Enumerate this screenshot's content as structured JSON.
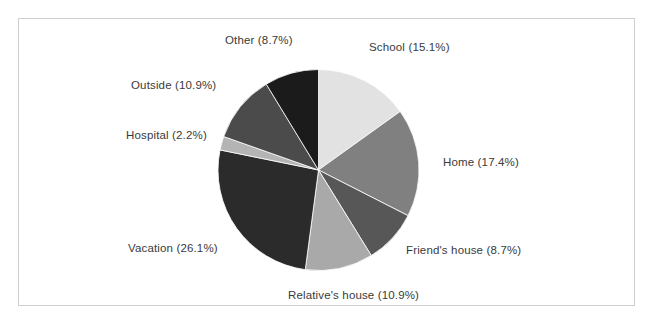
{
  "figure": {
    "background_color": "#ffffff",
    "frame_color": "#cfcfcf"
  },
  "chart_data": {
    "type": "pie",
    "title": "",
    "xlabel": "",
    "ylabel": "",
    "legend_position": "none",
    "grid": false,
    "label_format": "{name} ({percent}%)",
    "start_angle_deg": 0,
    "direction": "clockwise",
    "total_percent": 100.1,
    "categories": [
      "School",
      "Home",
      "Friend's house",
      "Relative's house",
      "Vacation",
      "Hospital",
      "Outside",
      "Other"
    ],
    "values": [
      15.1,
      17.4,
      8.7,
      10.9,
      26.1,
      2.2,
      10.9,
      8.7
    ],
    "colors": [
      "#e2e2e2",
      "#808080",
      "#575757",
      "#a9a9a9",
      "#2b2b2b",
      "#b4b4b4",
      "#4b4b4b",
      "#1b1b1b"
    ],
    "slices": [
      {
        "name": "School",
        "percent": 15.1,
        "label": "School (15.1%)",
        "color": "#e2e2e2"
      },
      {
        "name": "Home",
        "percent": 17.4,
        "label": "Home (17.4%)",
        "color": "#808080"
      },
      {
        "name": "Friend's house",
        "percent": 8.7,
        "label": "Friend's house (8.7%)",
        "color": "#575757"
      },
      {
        "name": "Relative's house",
        "percent": 10.9,
        "label": "Relative's house (10.9%)",
        "color": "#a9a9a9"
      },
      {
        "name": "Vacation",
        "percent": 26.1,
        "label": "Vacation (26.1%)",
        "color": "#2b2b2b"
      },
      {
        "name": "Hospital",
        "percent": 2.2,
        "label": "Hospital (2.2%)",
        "color": "#b4b4b4"
      },
      {
        "name": "Outside",
        "percent": 10.9,
        "label": "Outside (10.9%)",
        "color": "#4b4b4b"
      },
      {
        "name": "Other",
        "percent": 8.7,
        "label": "Other (8.7%)",
        "color": "#1b1b1b"
      }
    ]
  },
  "labels": {
    "school": "School (15.1%)",
    "home": "Home (17.4%)",
    "friends_house": "Friend's house (8.7%)",
    "relatives_house": "Relative's house (10.9%)",
    "vacation": "Vacation (26.1%)",
    "hospital": "Hospital (2.2%)",
    "outside": "Outside (10.9%)",
    "other": "Other (8.7%)"
  }
}
